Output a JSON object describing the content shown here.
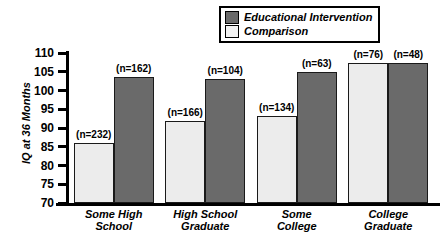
{
  "chart_data": {
    "type": "bar",
    "title": "",
    "xlabel": "",
    "ylabel": "IQ at 36 Months",
    "ylim": [
      70,
      110
    ],
    "ytick_step": 5,
    "yticks": [
      110,
      105,
      100,
      95,
      90,
      85,
      80,
      75,
      70
    ],
    "grid": false,
    "legend_position": "top-right",
    "categories": [
      "Some High School",
      "High School Graduate",
      "Some College",
      "College Graduate"
    ],
    "category_lines": [
      [
        "Some High",
        "School"
      ],
      [
        "High School",
        "Graduate"
      ],
      [
        "Some",
        "College"
      ],
      [
        "College",
        "Graduate"
      ]
    ],
    "series": [
      {
        "name": "Comparison",
        "color": "#ececec",
        "values": [
          86.0,
          92.0,
          93.2,
          107.3
        ],
        "n": [
          232,
          166,
          134,
          76
        ],
        "n_labels": [
          "(n=232)",
          "(n=166)",
          "(n=134)",
          "(n=76)"
        ]
      },
      {
        "name": "Educational Intervention",
        "color": "#6a6a6a",
        "values": [
          103.5,
          103.0,
          105.0,
          107.3
        ],
        "n": [
          162,
          104,
          63,
          48
        ],
        "n_labels": [
          "(n=162)",
          "(n=104)",
          "(n=63)",
          "(n=48)"
        ]
      }
    ]
  },
  "legend": {
    "items": [
      {
        "label": "Educational Intervention",
        "swatch": "dark"
      },
      {
        "label": "Comparison",
        "swatch": "light"
      }
    ]
  },
  "axis": {
    "y_title": "IQ at 36 Months",
    "tick_labels": [
      "110",
      "105",
      "100",
      "95",
      "90",
      "85",
      "80",
      "75",
      "70"
    ]
  },
  "colors": {
    "intervention": "#6a6a6a",
    "comparison": "#ececec",
    "axis": "#000000",
    "background": "#ffffff"
  }
}
